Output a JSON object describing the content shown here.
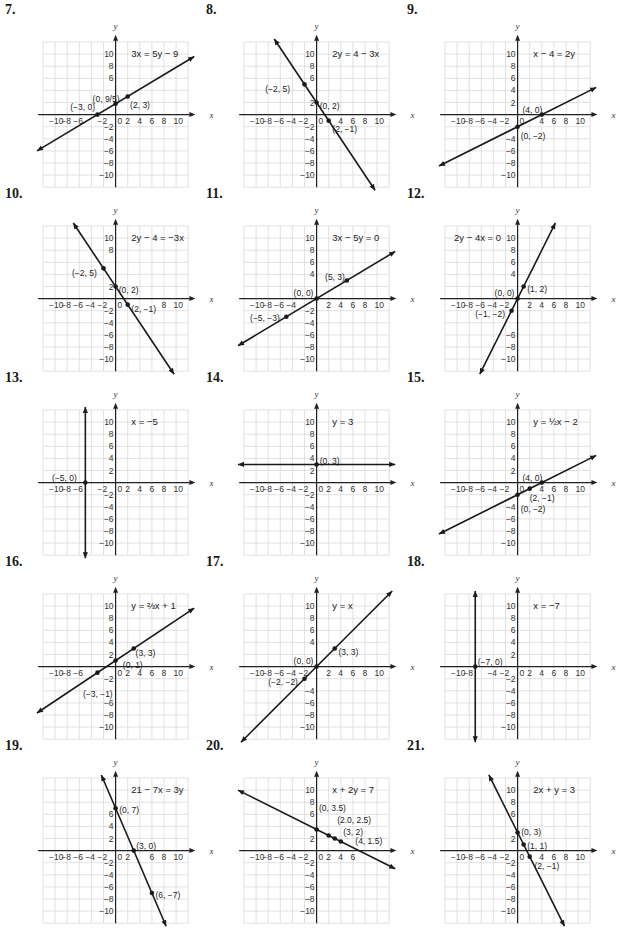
{
  "chart_data": [
    {
      "id": "7",
      "type": "line",
      "title": "3x = 5y − 9",
      "equation": "3x = 5y - 9",
      "line": {
        "kind": "slope",
        "m": 0.6,
        "b": 1.8
      },
      "points": [
        {
          "x": -3,
          "y": 0,
          "label": "(−3, 0)"
        },
        {
          "x": 0,
          "y": 1.8,
          "label": "(0, 9/5)"
        },
        {
          "x": 2,
          "y": 3,
          "label": "(2, 3)"
        }
      ],
      "xlabel": "x",
      "ylabel": "y",
      "xlim": [
        -12,
        12
      ],
      "ylim": [
        -12,
        12
      ],
      "grid": true
    },
    {
      "id": "8",
      "type": "line",
      "title": "2y = 4 − 3x",
      "equation": "2y = 4 - 3x",
      "line": {
        "kind": "slope",
        "m": -1.5,
        "b": 2
      },
      "points": [
        {
          "x": -2,
          "y": 5,
          "label": "(−2, 5)"
        },
        {
          "x": 0,
          "y": 2,
          "label": "(0, 2)"
        },
        {
          "x": 2,
          "y": -1,
          "label": "(2, −1)"
        }
      ],
      "xlabel": "x",
      "ylabel": "y",
      "xlim": [
        -12,
        12
      ],
      "ylim": [
        -12,
        12
      ],
      "grid": true
    },
    {
      "id": "9",
      "type": "line",
      "title": "x − 4 = 2y",
      "equation": "x - 4 = 2y",
      "line": {
        "kind": "slope",
        "m": 0.5,
        "b": -2
      },
      "points": [
        {
          "x": 4,
          "y": 0,
          "label": "(4, 0)"
        },
        {
          "x": 0,
          "y": -2,
          "label": "(0, −2)"
        }
      ],
      "xlabel": "x",
      "ylabel": "y",
      "xlim": [
        -12,
        12
      ],
      "ylim": [
        -12,
        12
      ],
      "grid": true
    },
    {
      "id": "10",
      "type": "line",
      "title": "2y − 4 = −3x",
      "equation": "2y - 4 = -3x",
      "line": {
        "kind": "slope",
        "m": -1.5,
        "b": 2
      },
      "points": [
        {
          "x": -2,
          "y": 5,
          "label": "(−2, 5)"
        },
        {
          "x": 0,
          "y": 2,
          "label": "(0, 2)"
        },
        {
          "x": 2,
          "y": -1,
          "label": "(2, −1)"
        }
      ],
      "xlabel": "x",
      "ylabel": "y",
      "xlim": [
        -12,
        12
      ],
      "ylim": [
        -12,
        12
      ],
      "grid": true
    },
    {
      "id": "11",
      "type": "line",
      "title": "3x − 5y = 0",
      "equation": "3x - 5y = 0",
      "line": {
        "kind": "slope",
        "m": 0.6,
        "b": 0
      },
      "points": [
        {
          "x": 5,
          "y": 3,
          "label": "(5, 3)"
        },
        {
          "x": 0,
          "y": 0,
          "label": "(0, 0)"
        },
        {
          "x": -5,
          "y": -3,
          "label": "(−5, −3)"
        }
      ],
      "xlabel": "x",
      "ylabel": "y",
      "xlim": [
        -12,
        12
      ],
      "ylim": [
        -12,
        12
      ],
      "grid": true
    },
    {
      "id": "12",
      "type": "line",
      "title": "2y − 4x = 0",
      "equation": "2y - 4x = 0",
      "line": {
        "kind": "slope",
        "m": 2,
        "b": 0
      },
      "points": [
        {
          "x": 1,
          "y": 2,
          "label": "(1, 2)"
        },
        {
          "x": 0,
          "y": 0,
          "label": "(0, 0)"
        },
        {
          "x": -1,
          "y": -2,
          "label": "(−1, −2)"
        }
      ],
      "xlabel": "x",
      "ylabel": "y",
      "xlim": [
        -12,
        12
      ],
      "ylim": [
        -12,
        12
      ],
      "grid": true
    },
    {
      "id": "13",
      "type": "line",
      "title": "x = −5",
      "equation": "x = -5",
      "line": {
        "kind": "vertical",
        "x": -5
      },
      "points": [
        {
          "x": -5,
          "y": 0,
          "label": "(−5, 0)"
        }
      ],
      "xlabel": "x",
      "ylabel": "y",
      "xlim": [
        -12,
        12
      ],
      "ylim": [
        -12,
        12
      ],
      "grid": true
    },
    {
      "id": "14",
      "type": "line",
      "title": "y = 3",
      "equation": "y = 3",
      "line": {
        "kind": "slope",
        "m": 0,
        "b": 3
      },
      "points": [
        {
          "x": 0,
          "y": 3,
          "label": "(0, 3)"
        }
      ],
      "xlabel": "x",
      "ylabel": "y",
      "xlim": [
        -12,
        12
      ],
      "ylim": [
        -12,
        12
      ],
      "grid": true
    },
    {
      "id": "15",
      "type": "line",
      "title": "y = ½x − 2",
      "equation": "y = 1/2 x - 2",
      "line": {
        "kind": "slope",
        "m": 0.5,
        "b": -2
      },
      "points": [
        {
          "x": 4,
          "y": 0,
          "label": "(4, 0)"
        },
        {
          "x": 2,
          "y": -1,
          "label": "(2, −1)"
        },
        {
          "x": 0,
          "y": -2,
          "label": "(0, −2)"
        }
      ],
      "xlabel": "x",
      "ylabel": "y",
      "xlim": [
        -12,
        12
      ],
      "ylim": [
        -12,
        12
      ],
      "grid": true
    },
    {
      "id": "16",
      "type": "line",
      "title": "y = ⅔x + 1",
      "equation": "y = 2/3 x + 1",
      "line": {
        "kind": "slope",
        "m": 0.6667,
        "b": 1
      },
      "points": [
        {
          "x": 3,
          "y": 3,
          "label": "(3, 3)"
        },
        {
          "x": 0,
          "y": 1,
          "label": "(0, 1)"
        },
        {
          "x": -3,
          "y": -1,
          "label": "(−3, −1)"
        }
      ],
      "xlabel": "x",
      "ylabel": "y",
      "xlim": [
        -12,
        12
      ],
      "ylim": [
        -12,
        12
      ],
      "grid": true
    },
    {
      "id": "17",
      "type": "line",
      "title": "y = x",
      "equation": "y = x",
      "line": {
        "kind": "slope",
        "m": 1,
        "b": 0
      },
      "points": [
        {
          "x": 3,
          "y": 3,
          "label": "(3, 3)"
        },
        {
          "x": 0,
          "y": 0,
          "label": "(0, 0)"
        },
        {
          "x": -2,
          "y": -2,
          "label": "(−2, −2)"
        }
      ],
      "xlabel": "x",
      "ylabel": "y",
      "xlim": [
        -12,
        12
      ],
      "ylim": [
        -12,
        12
      ],
      "grid": true
    },
    {
      "id": "18",
      "type": "line",
      "title": "x = −7",
      "equation": "x = -7",
      "line": {
        "kind": "vertical",
        "x": -7
      },
      "points": [
        {
          "x": -7,
          "y": 0,
          "label": "(−7, 0)"
        }
      ],
      "xlabel": "x",
      "ylabel": "y",
      "xlim": [
        -12,
        12
      ],
      "ylim": [
        -12,
        12
      ],
      "grid": true
    },
    {
      "id": "19",
      "type": "line",
      "title": "21 − 7x = 3y",
      "equation": "21 - 7x = 3y",
      "line": {
        "kind": "slope",
        "m": -2.3333,
        "b": 7
      },
      "points": [
        {
          "x": 0,
          "y": 7,
          "label": "(0, 7)"
        },
        {
          "x": 3,
          "y": 0,
          "label": "(3, 0)"
        },
        {
          "x": 6,
          "y": -7,
          "label": "(6, −7)"
        }
      ],
      "xlabel": "x",
      "ylabel": "y",
      "xlim": [
        -12,
        12
      ],
      "ylim": [
        -12,
        12
      ],
      "grid": true
    },
    {
      "id": "20",
      "type": "line",
      "title": "x + 2y = 7",
      "equation": "x + 2y = 7",
      "line": {
        "kind": "slope",
        "m": -0.5,
        "b": 3.5
      },
      "points": [
        {
          "x": 0,
          "y": 3.5,
          "label": "(0, 3.5)"
        },
        {
          "x": 2,
          "y": 2.5,
          "label": "(2.0, 2.5)"
        },
        {
          "x": 3,
          "y": 2,
          "label": "(3, 2)"
        },
        {
          "x": 4,
          "y": 1.5,
          "label": "(4, 1.5)"
        }
      ],
      "xlabel": "x",
      "ylabel": "y",
      "xlim": [
        -12,
        12
      ],
      "ylim": [
        -12,
        12
      ],
      "grid": true
    },
    {
      "id": "21",
      "type": "line",
      "title": "2x + y = 3",
      "equation": "2x + y = 3",
      "line": {
        "kind": "slope",
        "m": -2,
        "b": 3
      },
      "points": [
        {
          "x": 0,
          "y": 3,
          "label": "(0, 3)"
        },
        {
          "x": 1,
          "y": 1,
          "label": "(1, 1)"
        },
        {
          "x": 2,
          "y": -1,
          "label": "(2, −1)"
        }
      ],
      "xlabel": "x",
      "ylabel": "y",
      "xlim": [
        -12,
        12
      ],
      "ylim": [
        -12,
        12
      ],
      "grid": true
    }
  ],
  "panels": [
    {
      "number": "7.",
      "equation": "3x = 5y − 9",
      "eq_pos": "tr",
      "labels": [
        {
          "t": "(−3, 0)",
          "x": -7.5,
          "y": 1.2
        },
        {
          "t": "(0, 9/5)",
          "x": -3.8,
          "y": 2.6
        },
        {
          "t": "(2, 3)",
          "x": 2.4,
          "y": 1.6
        }
      ],
      "x_ticks": [
        "−10",
        "−8",
        "−6",
        "",
        "−2",
        "0",
        "2",
        "4",
        "6",
        "8",
        "10"
      ],
      "y_ticks": [
        "10",
        "8",
        "6",
        "",
        "",
        "",
        "−2",
        "−4",
        "−6",
        "−8",
        "−10"
      ]
    },
    {
      "number": "8.",
      "equation": "2y = 4 − 3x",
      "eq_pos": "tr",
      "labels": [
        {
          "t": "(−2, 5)",
          "x": -8.5,
          "y": 4.3
        },
        {
          "t": "(0, 2)",
          "x": 0.5,
          "y": 1.4
        },
        {
          "t": "(2, −1)",
          "x": 2.6,
          "y": -2.3
        }
      ],
      "x_ticks": [
        "−10",
        "−8",
        "−6",
        "−4",
        "−2",
        "0",
        "",
        "4",
        "6",
        "8",
        "10"
      ],
      "y_ticks": [
        "10",
        "8",
        "6",
        "",
        "2",
        "",
        "−2",
        "−4",
        "−6",
        "−8",
        "−10"
      ]
    },
    {
      "number": "9.",
      "equation": "x − 4 = 2y",
      "eq_pos": "tr",
      "labels": [
        {
          "t": "(4, 0)",
          "x": 0.8,
          "y": 0.8
        },
        {
          "t": "(0, −2)",
          "x": 0.5,
          "y": -3.6
        }
      ],
      "x_ticks": [
        "−10",
        "−8",
        "−6",
        "−4",
        "−2",
        "0",
        "",
        "4",
        "6",
        "8",
        "10"
      ],
      "y_ticks": [
        "10",
        "8",
        "6",
        "4",
        "2",
        "",
        "",
        "−4",
        "−6",
        "−8",
        "−10"
      ]
    },
    {
      "number": "10.",
      "equation": "2y − 4 = −3x",
      "eq_pos": "tr",
      "labels": [
        {
          "t": "(−2, 5)",
          "x": -7.2,
          "y": 4.3
        },
        {
          "t": "(0, 2)",
          "x": 0.5,
          "y": 1.4
        },
        {
          "t": "(2, −1)",
          "x": 2.6,
          "y": -1.7
        }
      ],
      "x_ticks": [
        "−10",
        "−8",
        "−6",
        "−4",
        "−2",
        "0",
        "",
        "",
        "",
        "8",
        "10"
      ],
      "y_ticks": [
        "10",
        "8",
        "",
        "",
        "2",
        "",
        "−2",
        "−4",
        "−6",
        "−8",
        "−10"
      ]
    },
    {
      "number": "11.",
      "equation": "3x − 5y = 0",
      "eq_pos": "tr",
      "labels": [
        {
          "t": "(5, 3)",
          "x": 1.4,
          "y": 3.6
        },
        {
          "t": "(0, 0)",
          "x": -3.8,
          "y": 1
        },
        {
          "t": "(−5, −3)",
          "x": -11,
          "y": -3.2
        }
      ],
      "x_ticks": [
        "−10",
        "−8",
        "−6",
        "−4",
        "",
        "",
        "2",
        "4",
        "6",
        "8",
        "10"
      ],
      "y_ticks": [
        "10",
        "8",
        "6",
        "4",
        "",
        "",
        "−2",
        "−4",
        "−6",
        "−8",
        "−10"
      ]
    },
    {
      "number": "12.",
      "equation": "2y − 4x = 0",
      "eq_pos": "tl",
      "labels": [
        {
          "t": "(1, 2)",
          "x": 1.6,
          "y": 1.6
        },
        {
          "t": "(0, 0)",
          "x": -3.8,
          "y": 1
        },
        {
          "t": "(−1, −2)",
          "x": -7,
          "y": -2.6
        }
      ],
      "x_ticks": [
        "−10",
        "−8",
        "−6",
        "−4",
        "−2",
        "",
        "2",
        "4",
        "6",
        "8",
        "10"
      ],
      "y_ticks": [
        "10",
        "8",
        "6",
        "4",
        "",
        "",
        "",
        "",
        "−6",
        "−8",
        "−10"
      ]
    },
    {
      "number": "13.",
      "equation": "x = −5",
      "eq_pos": "tr",
      "labels": [
        {
          "t": "(−5, 0)",
          "x": -10.5,
          "y": 0.8
        }
      ],
      "x_ticks": [
        "−10",
        "−8",
        "−6",
        "",
        "−2",
        "0",
        "2",
        "4",
        "6",
        "8",
        "10"
      ],
      "y_ticks": [
        "10",
        "8",
        "6",
        "4",
        "2",
        "",
        "−2",
        "−4",
        "−6",
        "−8",
        "−10"
      ]
    },
    {
      "number": "14.",
      "equation": "y = 3",
      "eq_pos": "tr",
      "labels": [
        {
          "t": "(0, 3)",
          "x": 0.5,
          "y": 3.6
        }
      ],
      "x_ticks": [
        "−10",
        "−8",
        "−6",
        "−4",
        "−2",
        "0",
        "2",
        "4",
        "6",
        "8",
        "10"
      ],
      "y_ticks": [
        "10",
        "8",
        "6",
        "4",
        "2",
        "",
        "−2",
        "−4",
        "−6",
        "−8",
        "−10"
      ]
    },
    {
      "number": "15.",
      "equation": "y = ½x − 2",
      "eq_pos": "tr",
      "labels": [
        {
          "t": "(4, 0)",
          "x": 0.8,
          "y": 0.8
        },
        {
          "t": "(2, −1)",
          "x": 2,
          "y": -2.6
        },
        {
          "t": "(0, −2)",
          "x": 0.5,
          "y": -4.3
        }
      ],
      "x_ticks": [
        "−10",
        "−8",
        "−6",
        "−4",
        "−2",
        "0",
        "",
        "4",
        "6",
        "8",
        "10"
      ],
      "y_ticks": [
        "10",
        "8",
        "6",
        "4",
        "2",
        "",
        "",
        "−4",
        "−6",
        "−8",
        "−10"
      ]
    },
    {
      "number": "16.",
      "equation": "y = ⅔x + 1",
      "eq_pos": "tr",
      "labels": [
        {
          "t": "(3, 3)",
          "x": 3.3,
          "y": 2.3
        },
        {
          "t": "(0, 1)",
          "x": 1.2,
          "y": 0.3
        },
        {
          "t": "(−3, −1)",
          "x": -5.4,
          "y": -4.6
        }
      ],
      "x_ticks": [
        "−10",
        "−8",
        "−6",
        "",
        "",
        "0",
        "2",
        "4",
        "6",
        "8",
        "10"
      ],
      "y_ticks": [
        "10",
        "8",
        "6",
        "4",
        "2",
        "",
        "−2",
        "",
        "−6",
        "−8",
        "−10"
      ]
    },
    {
      "number": "17.",
      "equation": "y = x",
      "eq_pos": "tr",
      "labels": [
        {
          "t": "(3, 3)",
          "x": 3.6,
          "y": 2.4
        },
        {
          "t": "(0, 0)",
          "x": -3.8,
          "y": 1
        },
        {
          "t": "(−2, −2)",
          "x": -8,
          "y": -2.6
        }
      ],
      "x_ticks": [
        "−10",
        "−8",
        "−6",
        "−4",
        "−2",
        "",
        "2",
        "4",
        "6",
        "8",
        "10"
      ],
      "y_ticks": [
        "10",
        "8",
        "6",
        "4",
        "",
        "",
        "",
        "−4",
        "−6",
        "−8",
        "−10"
      ]
    },
    {
      "number": "18.",
      "equation": "x = −7",
      "eq_pos": "tr",
      "labels": [
        {
          "t": "(−7, 0)",
          "x": -6.6,
          "y": 0.8
        }
      ],
      "x_ticks": [
        "−10",
        "−8",
        "",
        "−4",
        "−2",
        "0",
        "2",
        "4",
        "6",
        "8",
        "10"
      ],
      "y_ticks": [
        "10",
        "8",
        "6",
        "4",
        "2",
        "",
        "−2",
        "−4",
        "−6",
        "−8",
        "−10"
      ]
    },
    {
      "number": "19.",
      "equation": "21 − 7x = 3y",
      "eq_pos": "tr",
      "labels": [
        {
          "t": "(0, 7)",
          "x": 0.6,
          "y": 6.7
        },
        {
          "t": "(3, 0)",
          "x": 3.4,
          "y": 0.8
        },
        {
          "t": "(6, −7)",
          "x": 6.6,
          "y": -7.3
        }
      ],
      "x_ticks": [
        "−10",
        "−8",
        "−6",
        "−4",
        "−2",
        "0",
        "2",
        "",
        "6",
        "8",
        "10"
      ],
      "y_ticks": [
        "",
        "",
        "6",
        "4",
        "2",
        "",
        "−2",
        "−4",
        "−6",
        "−8",
        "−10"
      ]
    },
    {
      "number": "20.",
      "equation": "x + 2y = 7",
      "eq_pos": "tr",
      "labels": [
        {
          "t": "(0, 3.5)",
          "x": 0.4,
          "y": 7
        },
        {
          "t": "(2.0, 2.5)",
          "x": 3.4,
          "y": 5
        },
        {
          "t": "(3, 2)",
          "x": 4.4,
          "y": 3.1
        },
        {
          "t": "(4, 1.5)",
          "x": 6.4,
          "y": 1.6
        }
      ],
      "x_ticks": [
        "−10",
        "−8",
        "−6",
        "−4",
        "−2",
        "0",
        "2",
        "4",
        "6",
        "",
        ""
      ],
      "y_ticks": [
        "10",
        "8",
        "6",
        "",
        "2",
        "",
        "−2",
        "−4",
        "−6",
        "−8",
        "−10"
      ]
    },
    {
      "number": "21.",
      "equation": "2x + y = 3",
      "eq_pos": "tr",
      "labels": [
        {
          "t": "(0, 3)",
          "x": 0.6,
          "y": 3
        },
        {
          "t": "(1, 1)",
          "x": 1.6,
          "y": 0.8
        },
        {
          "t": "(2, −1)",
          "x": 2.8,
          "y": -2.6
        }
      ],
      "x_ticks": [
        "−10",
        "−8",
        "−6",
        "−4",
        "−2",
        "0",
        "",
        "4",
        "6",
        "8",
        "10"
      ],
      "y_ticks": [
        "10",
        "8",
        "6",
        "",
        "2",
        "",
        "−2",
        "−4",
        "−6",
        "−8",
        "−10"
      ]
    }
  ]
}
